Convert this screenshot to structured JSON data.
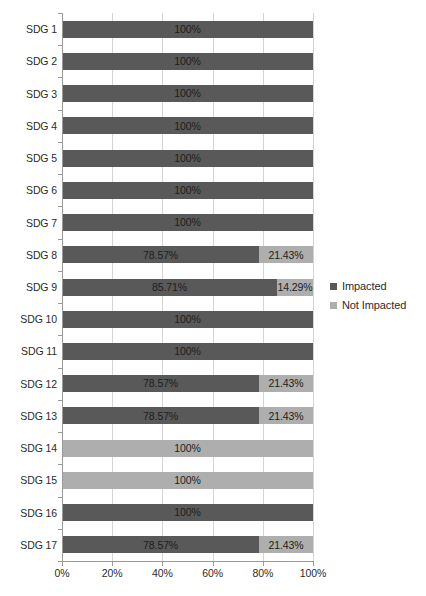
{
  "chart_data": {
    "type": "bar",
    "orientation": "horizontal",
    "stacked": true,
    "stacked_mode": "percent",
    "title": "",
    "subtitle": "",
    "xlabel": "",
    "ylabel": "",
    "xlim": [
      0,
      100
    ],
    "xticks": [
      0,
      20,
      40,
      60,
      80,
      100
    ],
    "xtick_labels": [
      "0%",
      "20%",
      "40%",
      "60%",
      "80%",
      "100%"
    ],
    "grid": "vertical",
    "legend_position": "right",
    "categories": [
      "SDG 1",
      "SDG 2",
      "SDG 3",
      "SDG 4",
      "SDG 5",
      "SDG 6",
      "SDG 7",
      "SDG 8",
      "SDG 9",
      "SDG 10",
      "SDG 11",
      "SDG 12",
      "SDG 13",
      "SDG 14",
      "SDG 15",
      "SDG 16",
      "SDG 17"
    ],
    "series": [
      {
        "name": "Impacted",
        "color": "#595959",
        "values": [
          100,
          100,
          100,
          100,
          100,
          100,
          100,
          78.57,
          85.71,
          100,
          100,
          78.57,
          78.57,
          0,
          0,
          100,
          78.57
        ],
        "labels": [
          "100%",
          "100%",
          "100%",
          "100%",
          "100%",
          "100%",
          "100%",
          "78.57%",
          "85.71%",
          "100%",
          "100%",
          "78.57%",
          "78.57%",
          "",
          "",
          "100%",
          "78.57%"
        ]
      },
      {
        "name": "Not Impacted",
        "color": "#aeaeae",
        "values": [
          0,
          0,
          0,
          0,
          0,
          0,
          0,
          21.43,
          14.29,
          0,
          0,
          21.43,
          21.43,
          100,
          100,
          0,
          21.43
        ],
        "labels": [
          "",
          "",
          "",
          "",
          "",
          "",
          "",
          "21.43%",
          "14.29%",
          "",
          "",
          "21.43%",
          "21.43%",
          "100%",
          "100%",
          "",
          "21.43%"
        ]
      }
    ]
  },
  "legend": {
    "items": [
      {
        "label": "Impacted",
        "color": "#595959"
      },
      {
        "label": "Not Impacted",
        "color": "#aeaeae"
      }
    ]
  },
  "colors": {
    "impacted": "#595959",
    "not_impacted": "#aeaeae",
    "gridline": "#d4d4d4",
    "axis": "#9a9a9a",
    "text": "#2b2b2b",
    "background": "#ffffff"
  }
}
